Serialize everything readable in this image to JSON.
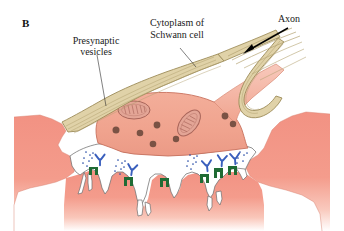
{
  "figure": {
    "panel_letter": "B",
    "background_color": "#ffffff",
    "width": 344,
    "height": 231
  },
  "labels": {
    "presynaptic_vesicles": {
      "line1": "Presynaptic",
      "line2": "vesicles"
    },
    "cytoplasm_schwann": {
      "line1": "Cytoplasm of",
      "line2": "Schwann cell"
    },
    "axon": "Axon"
  },
  "colors": {
    "muscle_fiber": "#f29283",
    "muscle_fiber_light": "#f4a694",
    "nerve_terminal": "#f0a38e",
    "nerve_terminal_outline": "#c8705c",
    "schwann_sheath": "#e0d2a8",
    "schwann_sheath_outline": "#9c8b58",
    "schwann_stripe": "#b3a271",
    "synaptic_vesicle_dark": "#7a5244",
    "mitochondria_fill": "#e3a596",
    "mitochondria_outline": "#a9655a",
    "cleft_white": "#ffffff",
    "receptor_green": "#1f6b34",
    "antibody_blue": "#3a5fbd",
    "transmitter_dot": "#2b4fa8",
    "label_text": "#1a1a1a",
    "leader_line": "#2b2b2b",
    "arrow_black": "#000000"
  },
  "structures": {
    "nerve_terminal": {
      "name": "presynaptic nerve terminal",
      "vesicle_count": 9,
      "mitochondria_count": 2
    },
    "schwann_cell": {
      "name": "Schwann cell cytoplasm sheath",
      "striation_count": 6
    },
    "synaptic_cleft": {
      "name": "synaptic cleft with junctional folds",
      "fold_count": 6
    },
    "receptors": {
      "name": "acetylcholine receptor clusters",
      "count": 6
    },
    "antibodies": {
      "name": "bound antibody molecules",
      "count": 5
    },
    "transmitter_clusters": {
      "name": "released neurotransmitter",
      "count": 4
    }
  }
}
